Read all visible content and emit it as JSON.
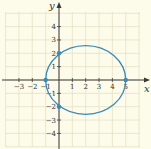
{
  "chart_data": {
    "type": "line",
    "title": "",
    "xlabel": "x",
    "ylabel": "y",
    "xlim": [
      -4,
      6
    ],
    "ylim": [
      -5,
      5
    ],
    "grid": true,
    "x_ticks": [
      -3,
      -2,
      -1,
      1,
      2,
      3,
      4,
      5
    ],
    "x_tick_labels": [
      "−3",
      "−2",
      "−1",
      "1",
      "2",
      "3",
      "4",
      "5"
    ],
    "y_ticks": [
      4,
      3,
      2,
      1,
      -1,
      -2,
      -3,
      -4
    ],
    "y_tick_labels": [
      "4",
      "3",
      "2",
      "1",
      "−1",
      "−2",
      "−3",
      "−4"
    ],
    "series": [
      {
        "name": "ellipse",
        "shape": "ellipse",
        "center": [
          2,
          0
        ],
        "semi_axis_x": 3,
        "semi_axis_y": 2.58,
        "color": "#3a8ab8"
      }
    ],
    "points": [
      {
        "x": -1,
        "y": 0
      },
      {
        "x": 5,
        "y": 0
      },
      {
        "x": 0,
        "y": 2
      },
      {
        "x": 0,
        "y": -2
      }
    ]
  },
  "colors": {
    "background": "#fdfbea",
    "grid": "#e6e1c6",
    "axis": "#3a3a3a",
    "curve": "#3a8ab8"
  }
}
